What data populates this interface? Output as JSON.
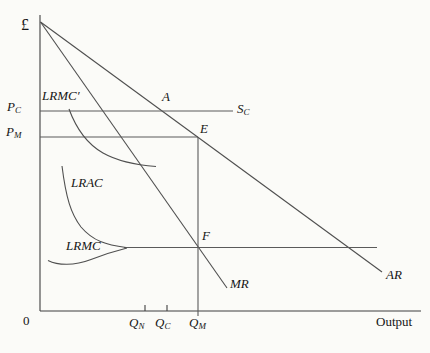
{
  "figure": {
    "colors": {
      "background": "#fbfbf8",
      "line": "#4f4f4f",
      "text": "#161616"
    },
    "y_axis_label": "£",
    "x_axis_label": "Output",
    "origin_label": "0",
    "price_labels": {
      "pc": {
        "main": "P",
        "sub": "C"
      },
      "pm": {
        "main": "P",
        "sub": "M"
      }
    },
    "quantity_labels": {
      "qn": {
        "main": "Q",
        "sub": "N"
      },
      "qc": {
        "main": "Q",
        "sub": "C"
      },
      "qm": {
        "main": "Q",
        "sub": "M"
      }
    },
    "curve_labels": {
      "lrmc_prime": "LRMC′",
      "lrac": "LRAC",
      "lrmc": "LRMC",
      "mr": "MR",
      "ar": "AR",
      "sc": {
        "main": "S",
        "sub": "C"
      }
    },
    "point_labels": {
      "a": "A",
      "e": "E",
      "f": "F"
    }
  }
}
